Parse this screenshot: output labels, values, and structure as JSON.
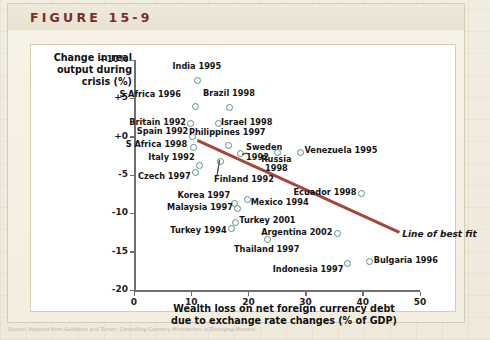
{
  "figure": {
    "label": "FIGURE 15-9",
    "caption_strip": "Source: Adapted from Goldstein and Turner, Controlling Currency Mismatches in Emerging Markets."
  },
  "chart_data": {
    "type": "scatter",
    "title": "",
    "xlabel": "Wealth loss on net foreign currency debt\ndue to exchange rate changes (% of GDP)",
    "xlabel_line1": "Wealth loss on net foreign currency debt",
    "xlabel_line2": "due to exchange rate changes (% of GDP)",
    "ylabel": "Change in real\noutput during\ncrisis (%)",
    "ylabel_line1": "Change in real",
    "ylabel_line2": "output during",
    "ylabel_line3": "crisis (%)",
    "xlim": [
      0,
      50
    ],
    "ylim": [
      -20,
      10
    ],
    "xticks": [
      0,
      10,
      20,
      30,
      40,
      50
    ],
    "xtick_labels": [
      "0",
      "10",
      "20",
      "30",
      "40",
      "50"
    ],
    "yticks": [
      10,
      5,
      0,
      -5,
      -10,
      -15,
      -20
    ],
    "ytick_labels": [
      "+10%",
      "+5",
      "+0",
      "-5",
      "-10",
      "-15",
      "-20"
    ],
    "grid": false,
    "marker_color": "#5b8f7e",
    "line_color": "#a8453a",
    "points": [
      {
        "label": "India 1995",
        "x": 11.0,
        "y": 7.4,
        "lx": 11.0,
        "ly": 9.1,
        "align": "center"
      },
      {
        "label": "S Africa 1996",
        "x": 10.6,
        "y": 4.1,
        "lx": 8.2,
        "ly": 5.5,
        "align": "right"
      },
      {
        "label": "Brazil 1998",
        "x": 16.6,
        "y": 4.0,
        "lx": 16.6,
        "ly": 5.6,
        "align": "center"
      },
      {
        "label": "Britain 1992",
        "x": 9.7,
        "y": 1.8,
        "lx": 9.1,
        "ly": 1.8,
        "align": "right"
      },
      {
        "label": "Israel 1998",
        "x": 14.6,
        "y": 1.8,
        "lx": 15.2,
        "ly": 1.8,
        "align": "left"
      },
      {
        "label": "Spain 1992",
        "x": 10.1,
        "y": 0.2,
        "lx": 9.5,
        "ly": 0.6,
        "align": "right"
      },
      {
        "label": "Philippines 1997",
        "x": 16.3,
        "y": -1.0,
        "lx": 16.3,
        "ly": 0.5,
        "align": "center"
      },
      {
        "label": "S Africa 1998",
        "x": 10.3,
        "y": -1.3,
        "lx": 9.3,
        "ly": -1.1,
        "align": "right"
      },
      {
        "label": "Sweden\n1992",
        "x": 18.5,
        "y": -2.0,
        "lx": 19.6,
        "ly": -1.5,
        "align": "left"
      },
      {
        "label": "Russia\n1998",
        "x": 24.9,
        "y": -1.9,
        "lx": 24.9,
        "ly": -3.0,
        "align": "center"
      },
      {
        "label": "Venezuela 1995",
        "x": 28.9,
        "y": -1.9,
        "lx": 29.8,
        "ly": -1.9,
        "align": "left"
      },
      {
        "label": "Italy 1992",
        "x": 11.3,
        "y": -3.6,
        "lx": 10.6,
        "ly": -2.8,
        "align": "right"
      },
      {
        "label": "Czech 1997",
        "x": 10.5,
        "y": -4.5,
        "lx": 9.9,
        "ly": -5.3,
        "align": "right"
      },
      {
        "label": "Finland 1992",
        "x": 15.0,
        "y": -3.1,
        "lx": 14.0,
        "ly": -5.6,
        "align": "left"
      },
      {
        "label": "Ecuador 1998",
        "x": 39.6,
        "y": -7.3,
        "lx": 38.9,
        "ly": -7.3,
        "align": "right"
      },
      {
        "label": "Korea 1997",
        "x": 17.4,
        "y": -8.6,
        "lx": 16.8,
        "ly": -7.7,
        "align": "right"
      },
      {
        "label": "Mexico 1994",
        "x": 19.6,
        "y": -8.0,
        "lx": 20.4,
        "ly": -8.6,
        "align": "left"
      },
      {
        "label": "Malaysia 1997",
        "x": 18.0,
        "y": -9.2,
        "lx": 17.3,
        "ly": -9.3,
        "align": "right"
      },
      {
        "label": "Turkey 2001",
        "x": 17.6,
        "y": -11.0,
        "lx": 18.4,
        "ly": -11.0,
        "align": "left"
      },
      {
        "label": "Turkey 1994",
        "x": 16.8,
        "y": -11.8,
        "lx": 16.2,
        "ly": -12.3,
        "align": "right"
      },
      {
        "label": "Argentina 2002",
        "x": 35.4,
        "y": -12.5,
        "lx": 34.7,
        "ly": -12.5,
        "align": "right"
      },
      {
        "label": "Thailand 1997",
        "x": 23.2,
        "y": -13.3,
        "lx": 23.2,
        "ly": -14.8,
        "align": "center"
      },
      {
        "label": "Indonesia 1997",
        "x": 37.2,
        "y": -16.4,
        "lx": 36.6,
        "ly": -17.4,
        "align": "right"
      },
      {
        "label": "Bulgaria 1996",
        "x": 41.0,
        "y": -16.2,
        "lx": 41.9,
        "ly": -16.2,
        "align": "left"
      }
    ],
    "best_fit_line": {
      "label": "Line of best fit",
      "x1": 11.2,
      "y1": -0.3,
      "x2": 46.5,
      "y2": -12.3,
      "label_x": 46.9,
      "label_y": -12.8
    }
  }
}
